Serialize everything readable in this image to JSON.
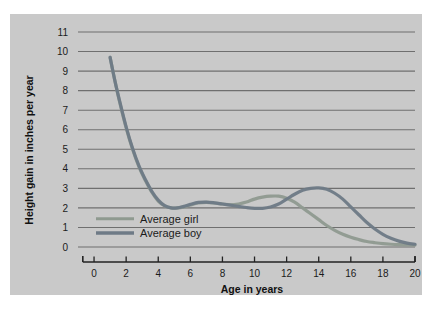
{
  "chart_data": {
    "type": "line",
    "title": "",
    "xlabel": "Age in years",
    "ylabel": "Height gain in inches per year",
    "xlim": [
      -1,
      20
    ],
    "ylim": [
      0,
      11
    ],
    "xticks": [
      0,
      2,
      4,
      6,
      8,
      10,
      12,
      14,
      16,
      18,
      20
    ],
    "xtick_labels": [
      "0",
      "2",
      "4",
      "6",
      "8",
      "10",
      "12",
      "14",
      "16",
      "18",
      "20"
    ],
    "yticks": [
      0,
      1,
      2,
      3,
      4,
      5,
      6,
      7,
      8,
      9,
      10,
      11
    ],
    "ytick_labels": [
      "0",
      "1",
      "2",
      "3",
      "4",
      "5",
      "6",
      "7",
      "8",
      "9",
      "10",
      "11"
    ],
    "grid": "horizontal",
    "legend_position": "inside-left-lower",
    "series": [
      {
        "name": "Average girl",
        "color": "#8f9a90",
        "x": [
          1.0,
          1.3,
          1.6,
          2.0,
          2.4,
          2.8,
          3.2,
          3.6,
          4.0,
          4.4,
          4.8,
          5.2,
          5.6,
          6.0,
          6.5,
          7.0,
          7.5,
          8.0,
          8.5,
          9.0,
          9.5,
          10.0,
          10.5,
          11.0,
          11.5,
          12.0,
          12.5,
          13.0,
          13.5,
          14.0,
          14.5,
          15.0,
          15.5,
          16.0,
          16.5,
          17.0,
          17.5,
          18.0,
          18.5,
          19.0,
          19.5,
          20.0
        ],
        "y": [
          9.7,
          8.5,
          7.4,
          6.1,
          5.0,
          4.1,
          3.4,
          2.8,
          2.35,
          2.1,
          2.0,
          2.0,
          2.05,
          2.15,
          2.25,
          2.28,
          2.25,
          2.2,
          2.16,
          2.2,
          2.3,
          2.45,
          2.55,
          2.6,
          2.6,
          2.5,
          2.3,
          2.0,
          1.7,
          1.4,
          1.1,
          0.85,
          0.65,
          0.5,
          0.38,
          0.28,
          0.22,
          0.17,
          0.14,
          0.12,
          0.11,
          0.1
        ]
      },
      {
        "name": "Average boy",
        "color": "#6e7a86",
        "x": [
          1.0,
          1.3,
          1.6,
          2.0,
          2.4,
          2.8,
          3.2,
          3.6,
          4.0,
          4.4,
          4.8,
          5.2,
          5.6,
          6.0,
          6.5,
          7.0,
          7.5,
          8.0,
          8.5,
          9.0,
          9.5,
          10.0,
          10.5,
          11.0,
          11.5,
          12.0,
          12.5,
          13.0,
          13.5,
          14.0,
          14.5,
          15.0,
          15.5,
          16.0,
          16.5,
          17.0,
          17.5,
          18.0,
          18.5,
          19.0,
          19.5,
          20.0
        ],
        "y": [
          9.7,
          8.5,
          7.45,
          6.15,
          5.05,
          4.15,
          3.45,
          2.85,
          2.4,
          2.12,
          2.0,
          2.0,
          2.08,
          2.18,
          2.28,
          2.3,
          2.26,
          2.2,
          2.14,
          2.08,
          2.02,
          1.98,
          1.98,
          2.05,
          2.2,
          2.45,
          2.7,
          2.9,
          3.0,
          3.02,
          2.95,
          2.75,
          2.45,
          2.05,
          1.65,
          1.25,
          0.92,
          0.65,
          0.45,
          0.3,
          0.2,
          0.14
        ]
      }
    ],
    "annotations": []
  },
  "legend": {
    "items": [
      {
        "label": "Average girl",
        "color": "#8f9a90"
      },
      {
        "label": "Average boy",
        "color": "#6e7a86"
      }
    ]
  },
  "colors": {
    "panel_background": "#c9c9c9",
    "gridline": "#6f6f6f",
    "axis": "#222222",
    "page_background": "#ffffff"
  }
}
